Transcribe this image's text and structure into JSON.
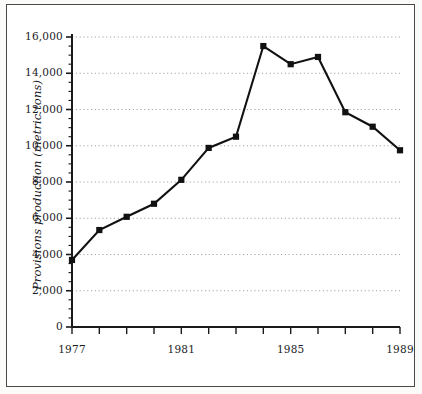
{
  "chart_data": {
    "type": "line",
    "title": "",
    "xlabel": "",
    "ylabel": "Provisions production (metric tons)",
    "x": [
      1977,
      1978,
      1979,
      1980,
      1981,
      1982,
      1983,
      1984,
      1985,
      1986,
      1987,
      1988,
      1989
    ],
    "values": [
      3700,
      5350,
      6080,
      6800,
      8120,
      9880,
      10500,
      15500,
      14500,
      14900,
      11850,
      11050,
      9750
    ],
    "series": [
      {
        "name": "Provisions production",
        "values": [
          3700,
          5350,
          6080,
          6800,
          8120,
          9880,
          10500,
          15500,
          14500,
          14900,
          11850,
          11050,
          9750
        ]
      }
    ],
    "xlim": [
      1977,
      1989
    ],
    "ylim": [
      0,
      16000
    ],
    "y_ticks": [
      0,
      2000,
      4000,
      6000,
      8000,
      10000,
      12000,
      14000,
      16000
    ],
    "y_tick_labels": [
      "0",
      "2,000",
      "4,000",
      "6,000",
      "8,000",
      "10,000",
      "12,000",
      "14,000",
      "16,000"
    ],
    "y_minor_tick_step": 500,
    "x_ticks": [
      1977,
      1978,
      1979,
      1980,
      1981,
      1982,
      1983,
      1984,
      1985,
      1986,
      1987,
      1988,
      1989
    ],
    "x_tick_labels": [
      "1977",
      "",
      "",
      "",
      "1981",
      "",
      "",
      "",
      "1985",
      "",
      "",
      "",
      "1989"
    ],
    "grid": true,
    "grid_style": "dotted",
    "legend": false,
    "legend_position": "none",
    "marker": "square",
    "colors": {
      "line": "#111111",
      "marker": "#111111",
      "grid": "#9a9a9a",
      "axis": "#1a1a1a",
      "background": "#ffffff",
      "frame": "#4a4a4a"
    }
  }
}
